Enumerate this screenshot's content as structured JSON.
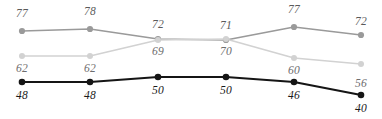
{
  "chart_data": {
    "type": "line",
    "title": "",
    "subtitle": "",
    "xlabel": "",
    "ylabel": "",
    "categories": [
      "1",
      "2",
      "3",
      "4",
      "5",
      "6"
    ],
    "x": [
      1,
      2,
      3,
      4,
      5,
      6
    ],
    "xlim": [
      1,
      6
    ],
    "ylim": [
      36,
      82
    ],
    "grid": false,
    "axes_visible": false,
    "legend": "none",
    "data_labels": true,
    "series": [
      {
        "name": "series-medium-gray",
        "color": "#9a9a9a",
        "marker": "circle",
        "values": [
          77,
          78,
          72,
          71,
          77,
          72
        ],
        "label_position": [
          "above",
          "above",
          "above",
          "above",
          "above",
          "above"
        ]
      },
      {
        "name": "series-light-gray",
        "color": "#d2d2d2",
        "marker": "circle",
        "values": [
          62,
          62,
          69,
          70,
          60,
          56
        ],
        "label_position": [
          "below",
          "below",
          "below",
          "below",
          "below",
          "below"
        ]
      },
      {
        "name": "series-black",
        "color": "#151515",
        "marker": "circle",
        "values": [
          48,
          48,
          50,
          50,
          46,
          40
        ],
        "label_position": [
          "below",
          "below",
          "below",
          "below",
          "below",
          "below"
        ]
      }
    ],
    "pixel_layout": {
      "width": 382,
      "height": 119,
      "point_x": [
        22,
        90,
        158,
        226,
        294,
        361
      ],
      "series_point_y": [
        [
          31,
          29,
          39,
          40,
          27,
          35
        ],
        [
          56,
          56,
          40,
          39,
          58,
          64
        ],
        [
          82,
          82,
          77,
          77,
          82,
          95
        ]
      ],
      "label_y": [
        [
          8,
          6,
          19,
          20,
          4,
          16
        ],
        [
          63,
          63,
          46,
          46,
          65,
          78
        ],
        [
          90,
          90,
          85,
          85,
          90,
          103
        ]
      ]
    }
  }
}
